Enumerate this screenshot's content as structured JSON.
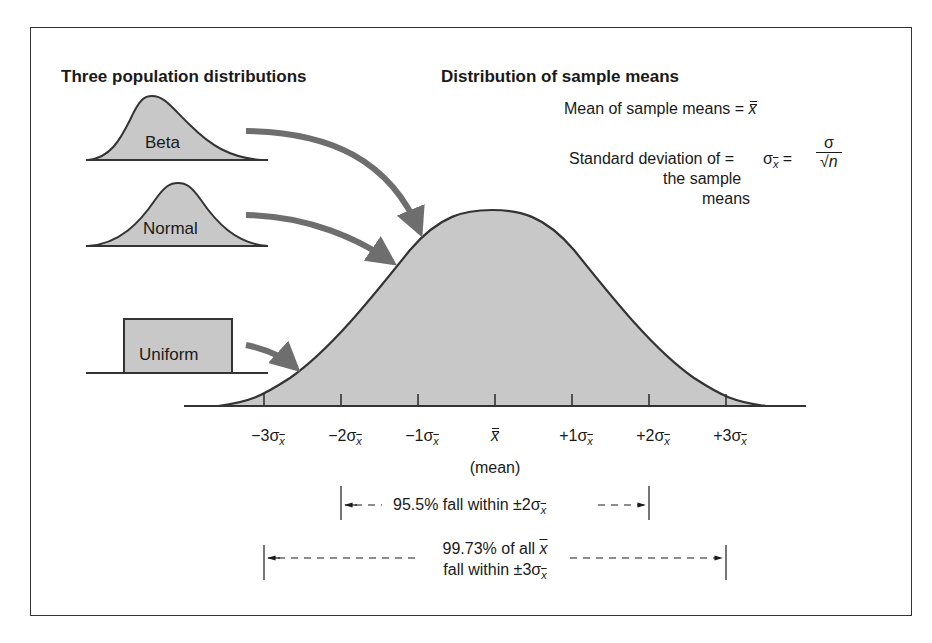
{
  "headings": {
    "left": "Three population distributions",
    "right": "Distribution of sample means"
  },
  "population_distributions": [
    {
      "name": "Beta",
      "shape": "right-skewed"
    },
    {
      "name": "Normal",
      "shape": "symmetric-bell"
    },
    {
      "name": "Uniform",
      "shape": "rectangle"
    }
  ],
  "formulas": {
    "mean_label": "Mean of sample means =",
    "mean_symbol": "x",
    "sd_label_line1": "Standard deviation of =",
    "sd_label_line2": "the sample",
    "sd_label_line3": "means",
    "sd_symbol": "σ",
    "sd_sub": "x",
    "equals": "=",
    "frac_num": "σ",
    "frac_den": "√n"
  },
  "axis": {
    "ticks": [
      {
        "sign": "−3σ",
        "sub": "x"
      },
      {
        "sign": "−2σ",
        "sub": "x"
      },
      {
        "sign": "−1σ",
        "sub": "x"
      },
      {
        "sign": "x",
        "sub": "",
        "is_mean": true
      },
      {
        "sign": "+1σ",
        "sub": "x"
      },
      {
        "sign": "+2σ",
        "sub": "x"
      },
      {
        "sign": "+3σ",
        "sub": "x"
      }
    ],
    "mean_caption": "(mean)"
  },
  "ranges": {
    "two_sigma": {
      "text": "95.5% fall within ±2σ",
      "sub": "x"
    },
    "three_sigma_line1": "99.73% of all",
    "three_sigma_sym": "x",
    "three_sigma_line2": "fall within ±3σ",
    "three_sigma_sub": "x"
  },
  "colors": {
    "fill": "#c8c8c8",
    "stroke": "#333333",
    "arrow": "#6e6e6e"
  }
}
